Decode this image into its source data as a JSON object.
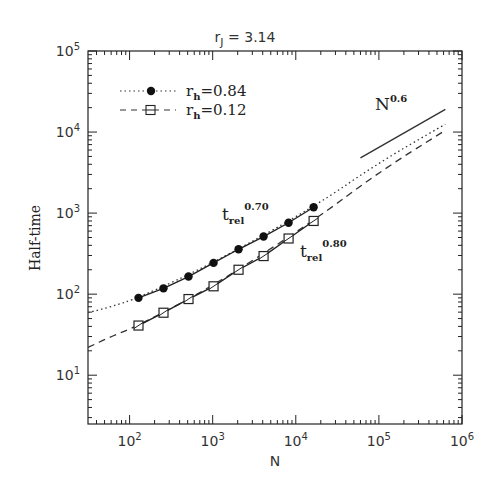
{
  "chart_data": {
    "type": "line",
    "title_main": "r",
    "title_sub": "J",
    "title_rest": " = 3.14",
    "xlabel": "N",
    "ylabel": "Half-time",
    "xscale": "log",
    "yscale": "log",
    "xlim": [
      31.6,
      1000000
    ],
    "ylim": [
      2.5,
      100000
    ],
    "x_ticks": [
      {
        "value": 100,
        "base": "10",
        "exp": "2"
      },
      {
        "value": 1000,
        "base": "10",
        "exp": "3"
      },
      {
        "value": 10000,
        "base": "10",
        "exp": "4"
      },
      {
        "value": 100000,
        "base": "10",
        "exp": "5"
      },
      {
        "value": 1000000,
        "base": "10",
        "exp": "6"
      }
    ],
    "y_ticks": [
      {
        "value": 10,
        "base": "10",
        "exp": "1"
      },
      {
        "value": 100,
        "base": "10",
        "exp": "2"
      },
      {
        "value": 1000,
        "base": "10",
        "exp": "3"
      },
      {
        "value": 10000,
        "base": "10",
        "exp": "4"
      },
      {
        "value": 100000,
        "base": "10",
        "exp": "5"
      }
    ],
    "grid": false,
    "legend_position": "upper left",
    "series": [
      {
        "name": "r_h=0.84",
        "legend_main": "r",
        "legend_sub": "h",
        "legend_rest": "=0.84",
        "marker": "filled-circle",
        "fit_linestyle": "dotted",
        "x": [
          128,
          256,
          512,
          1024,
          2048,
          4096,
          8192,
          16384
        ],
        "values": [
          90,
          118,
          165,
          243,
          358,
          514,
          760,
          1180
        ],
        "fit_curve": {
          "x": [
            31.6,
            60,
            128,
            1000,
            16384,
            100000,
            630000
          ],
          "y": [
            59,
            70,
            90,
            240,
            1180,
            4200,
            12500
          ]
        }
      },
      {
        "name": "r_h=0.12",
        "legend_main": "r",
        "legend_sub": "h",
        "legend_rest": "=0.12",
        "marker": "open-square",
        "fit_linestyle": "dashed",
        "x": [
          128,
          256,
          512,
          1024,
          2048,
          4096,
          8192,
          16384
        ],
        "values": [
          41,
          59,
          87,
          125,
          200,
          295,
          486,
          800
        ],
        "fit_curve": {
          "x": [
            31.6,
            60,
            128,
            1000,
            16384,
            100000,
            630000
          ],
          "y": [
            22,
            30,
            41,
            125,
            800,
            3200,
            10500
          ]
        }
      }
    ],
    "annotations": [
      {
        "text": "t_rel^0.70",
        "main": "t",
        "sub": "rel",
        "sup": "0.70",
        "near_series": "r_h=0.84"
      },
      {
        "text": "t_rel^0.80",
        "main": "t",
        "sub": "rel",
        "sup": "0.80",
        "near_series": "r_h=0.12"
      },
      {
        "text": "N^0.6",
        "main": "N",
        "sup": "0.6",
        "reference_line": {
          "x": [
            60000,
            630000
          ],
          "y": [
            4800,
            19000
          ]
        }
      }
    ]
  },
  "page": {
    "top_fragment": "a, ... ......... ......"
  }
}
